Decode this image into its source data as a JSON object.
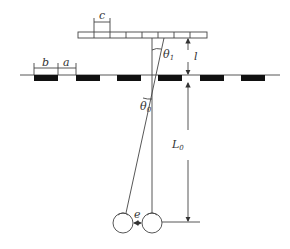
{
  "diagram": {
    "type": "optics-geometry",
    "labels": {
      "ruler_period": "c",
      "bar_width": "b",
      "gap_width": "a",
      "angle_top": "θ",
      "angle_top_sub": "1",
      "angle_bottom": "θ",
      "angle_bottom_sub": "0",
      "ruler_distance": "l",
      "eye_distance": "L",
      "eye_distance_sub": "0",
      "eye_separation": "e"
    },
    "colors": {
      "line": "#444444",
      "bar": "#111111",
      "background": "#ffffff"
    },
    "elements": {
      "ruler": {
        "x": 78,
        "y": 32,
        "width": 129,
        "height": 6,
        "segments": 8
      },
      "strip_line": {
        "x1": 20,
        "x2": 280,
        "y": 75
      },
      "bars": [
        {
          "x": 34
        },
        {
          "x": 76
        },
        {
          "x": 117
        },
        {
          "x": 158
        },
        {
          "x": 200
        },
        {
          "x": 241
        }
      ],
      "eyes": [
        {
          "name": "left-eye",
          "cx": 123,
          "cy": 223,
          "r": 10
        },
        {
          "name": "right-eye",
          "cx": 152,
          "cy": 223,
          "r": 10
        }
      ]
    }
  }
}
